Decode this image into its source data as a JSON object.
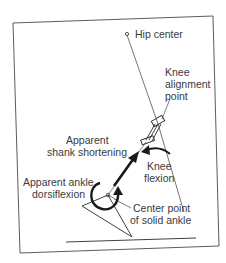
{
  "diagram": {
    "labels": {
      "hip_center": "Hip center",
      "knee_alignment_1": "Knee",
      "knee_alignment_2": "alignment",
      "knee_alignment_3": "point",
      "shank_shortening_1": "Apparent",
      "shank_shortening_2": "shank shortening",
      "knee_flexion_1": "Knee",
      "knee_flexion_2": "flexion",
      "ankle_dorsiflexion_1": "Apparent ankle",
      "ankle_dorsiflexion_2": "dorsiflexion",
      "solid_ankle_1": "Center point",
      "solid_ankle_2": "of solid ankle"
    },
    "colors": {
      "ink": "#2a2a2a",
      "text": "#3a3a3a",
      "background": "#ffffff"
    }
  }
}
